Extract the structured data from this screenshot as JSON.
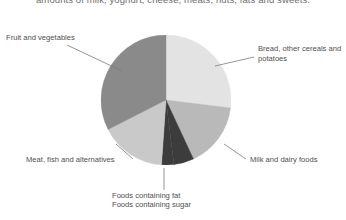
{
  "caption": {
    "text": "amounts of milk, yoghurt, cheese, meats, nuts, fats and sweets."
  },
  "chart_data": {
    "type": "pie",
    "title": "",
    "subtitle": "",
    "xlabel": "",
    "ylabel": "",
    "legend_position": "callout-labels",
    "grid": false,
    "center": {
      "x": 166,
      "y": 100
    },
    "radius": 65,
    "categories": [
      "Bread, other cereals and potatoes",
      "Milk and dairy foods",
      "Foods containing fat",
      "Foods containing sugar",
      "Meat, fish and alternatives",
      "Fruit and vegetables"
    ],
    "values": [
      27,
      16,
      5,
      3,
      16,
      33
    ],
    "slices": [
      {
        "label": "Bread, other cereals and potatoes",
        "value": 27,
        "color": "#e3e3e3",
        "start_angle": 0,
        "end_angle": 97
      },
      {
        "label": "Milk and dairy foods",
        "value": 16,
        "color": "#b9b9b9",
        "start_angle": 97,
        "end_angle": 155
      },
      {
        "label": "Foods containing fat",
        "value": 5,
        "color": "#3c3c3c",
        "start_angle": 155,
        "end_angle": 173
      },
      {
        "label": "Foods containing sugar",
        "value": 3,
        "color": "#3c3c3c",
        "start_angle": 173,
        "end_angle": 184
      },
      {
        "label": "Meat, fish and alternatives",
        "value": 16,
        "color": "#c9c9c9",
        "start_angle": 184,
        "end_angle": 243
      },
      {
        "label": "Fruit and vegetables",
        "value": 33,
        "color": "#8a8a8a",
        "start_angle": 243,
        "end_angle": 360
      }
    ]
  },
  "labels": {
    "fruit_and_vegetables": "Fruit and vegetables",
    "bread_other_cereals_and_potatoes": "Bread, other cereals and potatoes",
    "milk_and_dairy_foods": "Milk and dairy foods",
    "meat_fish_and_alternatives": "Meat, fish and alternatives",
    "foods_containing_fat": "Foods containing fat",
    "foods_containing_sugar": "Foods containing sugar"
  },
  "colors": {
    "background": "#ffffff",
    "text": "#4f4f4f",
    "caption_text": "#6e6e6e",
    "leader_line": "#7a7a7a",
    "slice_bread": "#e3e3e3",
    "slice_milk": "#b9b9b9",
    "slice_fat_sugar": "#3c3c3c",
    "slice_meat": "#c9c9c9",
    "slice_fruit": "#8a8a8a"
  }
}
